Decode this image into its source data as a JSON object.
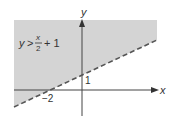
{
  "diagram": {
    "type": "linear-inequality-graph",
    "inequality": {
      "lhs": "y",
      "operator": ">",
      "numerator": "x",
      "denominator": "2",
      "constant": "+ 1"
    },
    "boundary_line": {
      "equation": "y = x/2 + 1",
      "style": "dashed",
      "slope": 0.5,
      "y_intercept": 1,
      "x_intercept": -2
    },
    "shaded_region": "above the line",
    "axes": {
      "x_label": "x",
      "y_label": "y"
    },
    "tick_labels": {
      "x_intercept_label": "−2",
      "y_intercept_label": "1"
    },
    "colors": {
      "shade": "#d4d4d4",
      "axis": "#444444",
      "line": "#555555",
      "text": "#333333"
    }
  }
}
